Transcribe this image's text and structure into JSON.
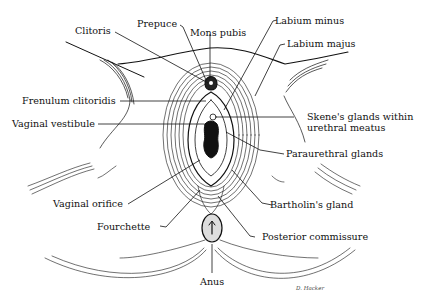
{
  "diagram": {
    "type": "anatomical illustration",
    "labels": [
      {
        "id": "clitoris",
        "text": "Clitoris"
      },
      {
        "id": "prepuce",
        "text": "Prepuce"
      },
      {
        "id": "mons_pubis",
        "text": "Mons pubis"
      },
      {
        "id": "labium_minus",
        "text": "Labium minus"
      },
      {
        "id": "labium_majus",
        "text": "Labium majus"
      },
      {
        "id": "frenulum_clitoridis",
        "text": "Frenulum clitoridis"
      },
      {
        "id": "vaginal_vestibule",
        "text": "Vaginal vestibule"
      },
      {
        "id": "skenes_glands_1",
        "text": "Skene's glands within"
      },
      {
        "id": "skenes_glands_2",
        "text": "urethral meatus"
      },
      {
        "id": "paraurethral_glands",
        "text": "Paraurethral glands"
      },
      {
        "id": "vaginal_orifice",
        "text": "Vaginal orifice"
      },
      {
        "id": "bartholins_gland",
        "text": "Bartholin's gland"
      },
      {
        "id": "fourchette",
        "text": "Fourchette"
      },
      {
        "id": "posterior_commissure",
        "text": "Posterior commissure"
      },
      {
        "id": "anus",
        "text": "Anus"
      }
    ],
    "signature": "D. Hacker"
  },
  "labels": {
    "clitoris": "Clitoris",
    "prepuce": "Prepuce",
    "mons_pubis": "Mons pubis",
    "labium_minus": "Labium minus",
    "labium_majus": "Labium majus",
    "frenulum_clitoridis": "Frenulum clitoridis",
    "vaginal_vestibule": "Vaginal vestibule",
    "skenes_1": "Skene's glands within",
    "skenes_2": "urethral meatus",
    "paraurethral_glands": "Paraurethral glands",
    "vaginal_orifice": "Vaginal orifice",
    "bartholins_gland": "Bartholin's gland",
    "fourchette": "Fourchette",
    "posterior_commissure": "Posterior commissure",
    "anus": "Anus",
    "signature": "D. Hacker"
  }
}
